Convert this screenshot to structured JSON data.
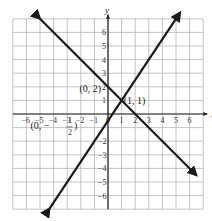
{
  "chart_data": {
    "type": "line",
    "title": "",
    "xlabel": "x",
    "ylabel": "y",
    "xlim": [
      -7,
      7
    ],
    "ylim": [
      -7,
      7
    ],
    "grid": true,
    "x_ticks": [
      -6,
      -5,
      -4,
      -3,
      -2,
      -1,
      0,
      1,
      2,
      3,
      4,
      5,
      6
    ],
    "y_ticks": [
      -6,
      -5,
      -4,
      -3,
      -2,
      1,
      2,
      3,
      4,
      5,
      6
    ],
    "x_tick_labels": [
      "-6",
      "-5",
      "-4",
      "-3",
      "-2",
      "-1",
      "0",
      "1",
      "2",
      "3",
      "4",
      "5",
      "6"
    ],
    "y_tick_labels": [
      "-6",
      "-5",
      "-4",
      "-3",
      "-2",
      "1",
      "2",
      "3",
      "4",
      "5",
      "6"
    ],
    "series": [
      {
        "name": "y = -x + 2",
        "slope": -1,
        "intercept": 2,
        "x": [
          -5,
          6.5
        ],
        "y": [
          7,
          -4.5
        ]
      },
      {
        "name": "y = 1.5x - 0.5",
        "slope": 1.5,
        "intercept": -0.5,
        "x": [
          -4.3,
          5.3
        ],
        "y": [
          -6.95,
          7.45
        ]
      }
    ],
    "annotations": [
      {
        "text": "(0, 2)",
        "x": 0,
        "y": 2
      },
      {
        "text": "(1, 1)",
        "x": 1,
        "y": 1
      },
      {
        "text": "(0, -1/2)",
        "x": 0,
        "y": -0.5
      }
    ]
  },
  "labels": {
    "x_axis": "x",
    "y_axis": "y",
    "point_a": "(0, 2)",
    "point_b": "(1, 1)",
    "point_c_prefix": "(0, −",
    "point_c_num": "1",
    "point_c_den": "2",
    "point_c_suffix": ")"
  },
  "colors": {
    "grid": "#b5b5b5",
    "axis": "#222222",
    "line": "#1a1a1a"
  }
}
